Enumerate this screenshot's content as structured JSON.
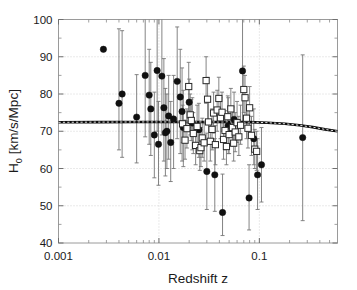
{
  "chart_data": {
    "type": "scatter",
    "title": "",
    "xlabel": "Redshift z",
    "ylabel": "H_0 [km/s/Mpc]",
    "ylabel_base": "H",
    "ylabel_sub": "0",
    "ylabel_rest": " [km/s/Mpc]",
    "xscale": "log",
    "yscale": "linear",
    "xlim": [
      0.001,
      0.6
    ],
    "ylim": [
      40,
      100
    ],
    "xticks": [
      0.001,
      0.01,
      0.1
    ],
    "xtick_labels": [
      "0.001",
      "0.01",
      "0.1"
    ],
    "yticks": [
      40,
      50,
      60,
      70,
      80,
      90,
      100
    ],
    "ytick_labels": [
      "40",
      "50",
      "60",
      "70",
      "80",
      "90",
      "100"
    ],
    "grid": "dotted major gridlines, horizontal and vertical",
    "legend": "none",
    "series": [
      {
        "name": "filled-circles",
        "marker": "filled circle",
        "color": "#101010",
        "points": [
          {
            "x": 0.0028,
            "y": 92.0,
            "ylo": 92.0,
            "yhi": 92.0
          },
          {
            "x": 0.004,
            "y": 77.5,
            "ylo": 65.0,
            "yhi": 97.5
          },
          {
            "x": 0.0043,
            "y": 80.0,
            "ylo": 63.0,
            "yhi": 97.0
          },
          {
            "x": 0.006,
            "y": 73.8,
            "ylo": 61.5,
            "yhi": 85.2
          },
          {
            "x": 0.0073,
            "y": 85.0,
            "ylo": 68.5,
            "yhi": 101.0
          },
          {
            "x": 0.008,
            "y": 79.7,
            "ylo": 66.5,
            "yhi": 92.0
          },
          {
            "x": 0.0083,
            "y": 76.0,
            "ylo": 63.5,
            "yhi": 88.5
          },
          {
            "x": 0.009,
            "y": 69.0,
            "ylo": 57.5,
            "yhi": 80.5
          },
          {
            "x": 0.0096,
            "y": 86.3,
            "ylo": 70.0,
            "yhi": 101.0
          },
          {
            "x": 0.0099,
            "y": 66.5,
            "ylo": 55.5,
            "yhi": 78.0
          },
          {
            "x": 0.0107,
            "y": 84.8,
            "ylo": 69.0,
            "yhi": 100.0
          },
          {
            "x": 0.0112,
            "y": 76.3,
            "ylo": 62.0,
            "yhi": 89.5
          },
          {
            "x": 0.0116,
            "y": 69.6,
            "ylo": 58.0,
            "yhi": 81.5
          },
          {
            "x": 0.012,
            "y": 70.0,
            "ylo": 60.0,
            "yhi": 80.0
          },
          {
            "x": 0.0125,
            "y": 74.1,
            "ylo": 62.5,
            "yhi": 85.0
          },
          {
            "x": 0.0131,
            "y": 67.0,
            "ylo": 56.5,
            "yhi": 78.0
          },
          {
            "x": 0.014,
            "y": 73.3,
            "ylo": 60.0,
            "yhi": 85.0
          },
          {
            "x": 0.0152,
            "y": 83.4,
            "ylo": 68.0,
            "yhi": 98.0
          },
          {
            "x": 0.0163,
            "y": 79.2,
            "ylo": 64.0,
            "yhi": 92.0
          },
          {
            "x": 0.017,
            "y": 75.3,
            "ylo": 62.0,
            "yhi": 87.0
          },
          {
            "x": 0.0175,
            "y": 71.0,
            "ylo": 60.5,
            "yhi": 81.0
          },
          {
            "x": 0.02,
            "y": 77.8,
            "ylo": 71.0,
            "yhi": 84.0
          },
          {
            "x": 0.0215,
            "y": 72.2,
            "ylo": 65.0,
            "yhi": 79.0
          },
          {
            "x": 0.025,
            "y": 70.4,
            "ylo": 63.0,
            "yhi": 77.5
          },
          {
            "x": 0.03,
            "y": 59.2,
            "ylo": 49.0,
            "yhi": 69.5
          },
          {
            "x": 0.036,
            "y": 58.3,
            "ylo": 48.5,
            "yhi": 68.0
          },
          {
            "x": 0.043,
            "y": 48.2,
            "ylo": 42.0,
            "yhi": 58.5
          },
          {
            "x": 0.049,
            "y": 71.5,
            "ylo": 64.0,
            "yhi": 79.0
          },
          {
            "x": 0.056,
            "y": 73.2,
            "ylo": 66.0,
            "yhi": 80.5
          },
          {
            "x": 0.068,
            "y": 86.2,
            "ylo": 71.5,
            "yhi": 100.5
          },
          {
            "x": 0.079,
            "y": 52.1,
            "ylo": 43.5,
            "yhi": 61.0
          },
          {
            "x": 0.088,
            "y": 68.0,
            "ylo": 61.0,
            "yhi": 76.0
          },
          {
            "x": 0.096,
            "y": 58.3,
            "ylo": 49.0,
            "yhi": 68.0
          },
          {
            "x": 0.105,
            "y": 61.0,
            "ylo": 51.0,
            "yhi": 71.0
          },
          {
            "x": 0.27,
            "y": 68.3,
            "ylo": 46.0,
            "yhi": 90.5
          }
        ]
      },
      {
        "name": "open-squares",
        "marker": "open square",
        "color": "#2a2a2a",
        "points": [
          {
            "x": 0.0172,
            "y": 72.0,
            "ylo": 67.0,
            "yhi": 77.0
          },
          {
            "x": 0.0182,
            "y": 67.6,
            "ylo": 62.5,
            "yhi": 73.0
          },
          {
            "x": 0.019,
            "y": 70.7,
            "ylo": 65.5,
            "yhi": 76.0
          },
          {
            "x": 0.0198,
            "y": 82.0,
            "ylo": 75.5,
            "yhi": 88.5
          },
          {
            "x": 0.0205,
            "y": 74.4,
            "ylo": 69.0,
            "yhi": 80.0
          },
          {
            "x": 0.021,
            "y": 72.9,
            "ylo": 67.5,
            "yhi": 78.5
          },
          {
            "x": 0.022,
            "y": 69.4,
            "ylo": 64.0,
            "yhi": 75.0
          },
          {
            "x": 0.0232,
            "y": 66.2,
            "ylo": 61.0,
            "yhi": 71.5
          },
          {
            "x": 0.024,
            "y": 71.3,
            "ylo": 66.0,
            "yhi": 77.0
          },
          {
            "x": 0.0255,
            "y": 64.8,
            "ylo": 59.5,
            "yhi": 70.0
          },
          {
            "x": 0.0262,
            "y": 65.6,
            "ylo": 60.5,
            "yhi": 71.0
          },
          {
            "x": 0.027,
            "y": 68.2,
            "ylo": 63.0,
            "yhi": 73.5
          },
          {
            "x": 0.0282,
            "y": 66.9,
            "ylo": 62.0,
            "yhi": 72.0
          },
          {
            "x": 0.0295,
            "y": 83.6,
            "ylo": 77.5,
            "yhi": 90.0
          },
          {
            "x": 0.0305,
            "y": 78.6,
            "ylo": 73.0,
            "yhi": 84.5
          },
          {
            "x": 0.0312,
            "y": 72.5,
            "ylo": 67.0,
            "yhi": 78.0
          },
          {
            "x": 0.0325,
            "y": 67.3,
            "ylo": 62.0,
            "yhi": 72.5
          },
          {
            "x": 0.0338,
            "y": 70.5,
            "ylo": 65.0,
            "yhi": 76.0
          },
          {
            "x": 0.035,
            "y": 74.9,
            "ylo": 69.5,
            "yhi": 80.5
          },
          {
            "x": 0.0365,
            "y": 66.4,
            "ylo": 61.0,
            "yhi": 71.5
          },
          {
            "x": 0.038,
            "y": 75.7,
            "ylo": 70.0,
            "yhi": 81.0
          },
          {
            "x": 0.0395,
            "y": 78.8,
            "ylo": 73.0,
            "yhi": 84.5
          },
          {
            "x": 0.041,
            "y": 73.6,
            "ylo": 68.0,
            "yhi": 79.0
          },
          {
            "x": 0.0425,
            "y": 75.1,
            "ylo": 70.0,
            "yhi": 80.5
          },
          {
            "x": 0.044,
            "y": 67.8,
            "ylo": 62.5,
            "yhi": 73.0
          },
          {
            "x": 0.0455,
            "y": 70.2,
            "ylo": 65.0,
            "yhi": 75.5
          },
          {
            "x": 0.047,
            "y": 65.9,
            "ylo": 61.0,
            "yhi": 71.0
          },
          {
            "x": 0.0485,
            "y": 73.9,
            "ylo": 68.5,
            "yhi": 79.5
          },
          {
            "x": 0.05,
            "y": 69.1,
            "ylo": 64.0,
            "yhi": 74.5
          },
          {
            "x": 0.052,
            "y": 76.0,
            "ylo": 70.5,
            "yhi": 81.5
          },
          {
            "x": 0.054,
            "y": 71.0,
            "ylo": 66.0,
            "yhi": 76.5
          },
          {
            "x": 0.0555,
            "y": 66.8,
            "ylo": 62.0,
            "yhi": 72.0
          },
          {
            "x": 0.0575,
            "y": 69.8,
            "ylo": 64.5,
            "yhi": 75.0
          },
          {
            "x": 0.06,
            "y": 72.3,
            "ylo": 67.0,
            "yhi": 78.0
          },
          {
            "x": 0.0625,
            "y": 68.5,
            "ylo": 63.5,
            "yhi": 74.0
          },
          {
            "x": 0.065,
            "y": 71.6,
            "ylo": 66.5,
            "yhi": 77.0
          },
          {
            "x": 0.07,
            "y": 81.2,
            "ylo": 75.0,
            "yhi": 87.5
          },
          {
            "x": 0.072,
            "y": 79.0,
            "ylo": 73.0,
            "yhi": 85.0
          },
          {
            "x": 0.0745,
            "y": 73.5,
            "ylo": 68.0,
            "yhi": 79.0
          },
          {
            "x": 0.077,
            "y": 70.8,
            "ylo": 65.5,
            "yhi": 76.0
          },
          {
            "x": 0.08,
            "y": 76.3,
            "ylo": 70.5,
            "yhi": 82.0
          },
          {
            "x": 0.0835,
            "y": 68.9,
            "ylo": 63.5,
            "yhi": 74.0
          },
          {
            "x": 0.09,
            "y": 65.2,
            "ylo": 60.0,
            "yhi": 70.5
          },
          {
            "x": 0.094,
            "y": 64.6,
            "ylo": 59.5,
            "yhi": 70.0
          }
        ]
      }
    ],
    "model_curve": {
      "name": "theoretical-model",
      "style": "thick solid black overlaid with white dash",
      "description": "flat near 72.5 then declining to about 70 at high z",
      "points": [
        {
          "x": 0.001,
          "y": 72.4
        },
        {
          "x": 0.0025,
          "y": 72.45
        },
        {
          "x": 0.006,
          "y": 72.5
        },
        {
          "x": 0.012,
          "y": 72.5
        },
        {
          "x": 0.025,
          "y": 72.5
        },
        {
          "x": 0.05,
          "y": 72.5
        },
        {
          "x": 0.08,
          "y": 72.45
        },
        {
          "x": 0.12,
          "y": 72.3
        },
        {
          "x": 0.18,
          "y": 72.0
        },
        {
          "x": 0.25,
          "y": 71.6
        },
        {
          "x": 0.34,
          "y": 71.1
        },
        {
          "x": 0.45,
          "y": 70.5
        },
        {
          "x": 0.6,
          "y": 70.0
        }
      ]
    }
  }
}
